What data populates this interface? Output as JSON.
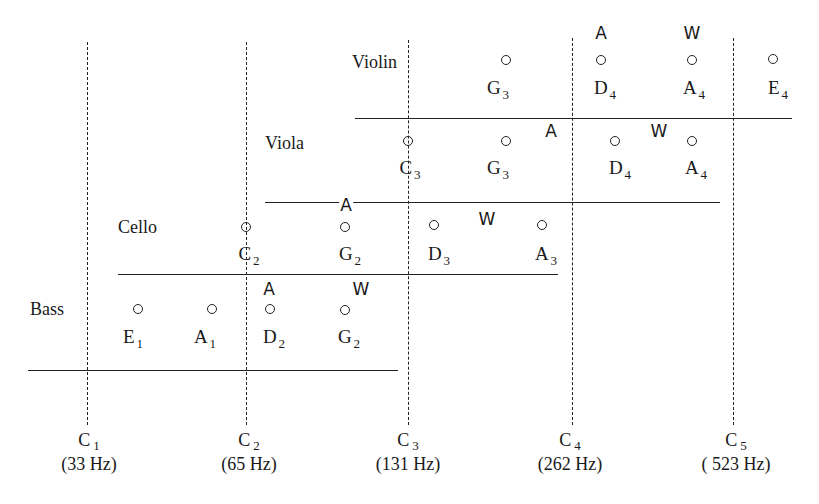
{
  "diagram": {
    "type": "string-instrument-ranges",
    "axis": {
      "ticks": [
        {
          "note": "C",
          "octave": "1",
          "freq": "(33 Hz)",
          "x": 87
        },
        {
          "note": "C",
          "octave": "2",
          "freq": "(65 Hz)",
          "x": 246
        },
        {
          "note": "C",
          "octave": "3",
          "freq": "(131 Hz)",
          "x": 408
        },
        {
          "note": "C",
          "octave": "4",
          "freq": "(262 Hz)",
          "x": 572
        },
        {
          "note": "C",
          "octave": "5",
          "freq": "( 523 Hz)",
          "x": 733
        }
      ]
    },
    "instruments": [
      {
        "name": "Violin",
        "strings": [
          {
            "note": "G",
            "octave": "3"
          },
          {
            "note": "D",
            "octave": "4"
          },
          {
            "note": "A",
            "octave": "4"
          },
          {
            "note": "E",
            "octave": "4"
          }
        ],
        "markers": {
          "A": "A",
          "W": "W"
        }
      },
      {
        "name": "Viola",
        "strings": [
          {
            "note": "C",
            "octave": "3"
          },
          {
            "note": "G",
            "octave": "3"
          },
          {
            "note": "D",
            "octave": "4"
          },
          {
            "note": "A",
            "octave": "4"
          }
        ],
        "markers": {
          "A": "A",
          "W": "W"
        }
      },
      {
        "name": "Cello",
        "strings": [
          {
            "note": "C",
            "octave": "2"
          },
          {
            "note": "G",
            "octave": "2"
          },
          {
            "note": "D",
            "octave": "3"
          },
          {
            "note": "A",
            "octave": "3"
          }
        ],
        "markers": {
          "A": "A",
          "W": "W"
        }
      },
      {
        "name": "Bass",
        "strings": [
          {
            "note": "E",
            "octave": "1"
          },
          {
            "note": "A",
            "octave": "1"
          },
          {
            "note": "D",
            "octave": "2"
          },
          {
            "note": "G",
            "octave": "2"
          }
        ],
        "markers": {
          "A": "A",
          "W": "W"
        }
      }
    ]
  }
}
